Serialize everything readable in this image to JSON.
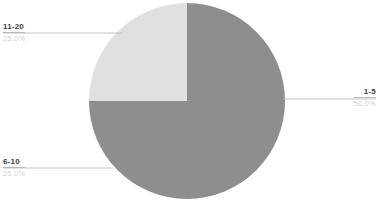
{
  "chart_data": {
    "type": "pie",
    "title": "",
    "categories": [
      "1-5",
      "6-10",
      "11-20"
    ],
    "values": [
      50.0,
      25.0,
      25.0
    ],
    "value_labels": [
      "50.0%",
      "25.0%",
      "25.0%"
    ],
    "colors": [
      "#8e8e8e",
      "#8e8e8e",
      "#e0e0e0"
    ],
    "legend": "none",
    "labels_position": "outside-callout",
    "start_angle_deg": 0,
    "direction": "clockwise",
    "slices": [
      {
        "name": "1-5",
        "label": "1-5",
        "percent_label": "50.0%",
        "value": 50.0,
        "color": "#8e8e8e",
        "start_deg": 0,
        "end_deg": 180,
        "callout_side": "right"
      },
      {
        "name": "6-10",
        "label": "6-10",
        "percent_label": "25.0%",
        "value": 25.0,
        "color": "#8e8e8e",
        "start_deg": 180,
        "end_deg": 270,
        "callout_side": "left"
      },
      {
        "name": "11-20",
        "label": "11-20",
        "percent_label": "25.0%",
        "value": 25.0,
        "color": "#e0e0e0",
        "start_deg": 270,
        "end_deg": 360,
        "callout_side": "left"
      }
    ],
    "geometry": {
      "center_x": 187,
      "center_y": 101,
      "radius": 98
    },
    "leader_line_color": "#b8b8b8",
    "background": "#ffffff"
  }
}
